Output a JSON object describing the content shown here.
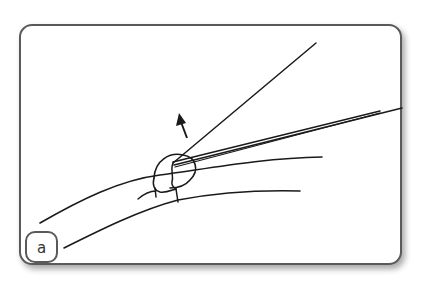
{
  "figure": {
    "panel_label": "a",
    "colors": {
      "stroke": "#1a1a1a",
      "frame": "#5a5a5a",
      "background": "#ffffff"
    },
    "elements": [
      "vessel-upper-wall",
      "vessel-lower-wall",
      "needle-holder-line",
      "suture-needle-double-line",
      "knot-loop",
      "direction-arrow"
    ]
  }
}
